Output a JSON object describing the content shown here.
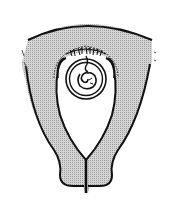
{
  "figure": {
    "labels": [],
    "colors": {
      "background": "#ffffff",
      "outline": "#111111",
      "wall_fill": "#bdbdbd",
      "cavity_fill": "#ffffff"
    }
  }
}
